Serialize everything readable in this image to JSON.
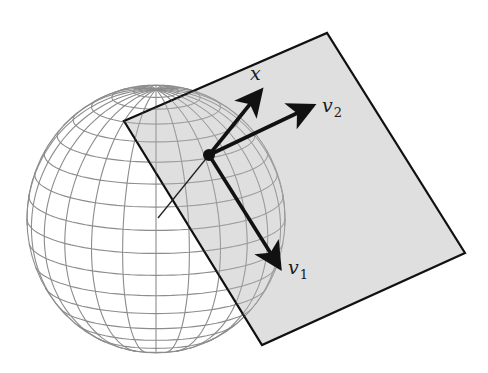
{
  "diagram": {
    "colors": {
      "background": "#ffffff",
      "sphere_grid": "#8c8c8c",
      "plane_fill": "#d6d6d6",
      "plane_edge": "#111111",
      "arrow": "#111111"
    },
    "sphere": {
      "cx": 156,
      "cy": 219,
      "rx": 129,
      "ry": 134,
      "meridians": 24,
      "parallels": 18
    },
    "plane": {
      "corners": [
        [
          124,
          121
        ],
        [
          327,
          33
        ],
        [
          465,
          253
        ],
        [
          262,
          345
        ]
      ]
    },
    "point": {
      "x": 209,
      "y": 155,
      "r": 6
    },
    "normal_line": {
      "from": [
        209,
        155
      ],
      "to": [
        158,
        218
      ]
    },
    "vectors": [
      {
        "id": "x",
        "label": "x",
        "subscript": "",
        "from": [
          209,
          155
        ],
        "to": [
          259,
          93
        ],
        "label_pos": [
          250,
          80
        ]
      },
      {
        "id": "v2",
        "label": "v",
        "subscript": "2",
        "from": [
          209,
          155
        ],
        "to": [
          310,
          107
        ],
        "label_pos": [
          322,
          112
        ]
      },
      {
        "id": "v1",
        "label": "v",
        "subscript": "1",
        "from": [
          209,
          155
        ],
        "to": [
          278,
          265
        ],
        "label_pos": [
          288,
          274
        ]
      }
    ]
  }
}
